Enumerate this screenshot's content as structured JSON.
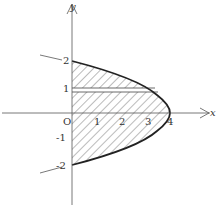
{
  "diagram": {
    "type": "parabola region",
    "curve": "x = 4 - y^2",
    "axes": {
      "x_label": "x",
      "y_label": "y",
      "origin_label": "O"
    },
    "x_ticks": [
      "1",
      "2",
      "3",
      "4"
    ],
    "y_ticks": [
      "2",
      "1",
      "-1",
      "-2"
    ],
    "shaded_region": "bounded by y-axis and curve x = 4 - y^2 from y=-2 to y=2",
    "strip": {
      "label": "horizontal strip near y = 1"
    }
  }
}
